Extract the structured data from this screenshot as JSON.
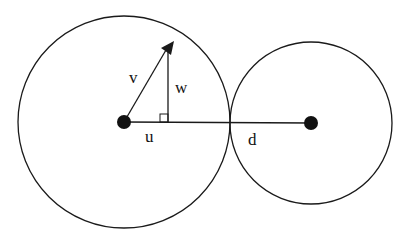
{
  "diagram": {
    "labels": {
      "v": "v",
      "w": "w",
      "u": "u",
      "d": "d"
    },
    "colors": {
      "stroke": "#1a1a1a",
      "background": "#ffffff"
    },
    "shapes": {
      "left_circle": {
        "cx": 124,
        "cy": 122,
        "r": 106
      },
      "right_circle": {
        "cx": 311,
        "cy": 123,
        "r": 81
      },
      "left_center_dot": {
        "cx": 124,
        "cy": 122,
        "r": 7
      },
      "right_center_dot": {
        "cx": 311,
        "cy": 123,
        "r": 7
      },
      "center_line": {
        "x1": 124,
        "y1": 122,
        "x2": 311,
        "y2": 123
      },
      "vector_v": {
        "x1": 124,
        "y1": 122,
        "x2": 170,
        "y2": 44
      },
      "component_w": {
        "x1": 168,
        "y1": 48,
        "x2": 168,
        "y2": 122
      },
      "right_angle_marker": {
        "x": 160,
        "y": 114,
        "size": 8
      }
    }
  }
}
